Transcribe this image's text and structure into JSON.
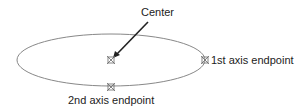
{
  "diagram": {
    "labels": {
      "center": "Center",
      "first_axis": "1st axis endpoint",
      "second_axis": "2nd axis endpoint"
    },
    "colors": {
      "ellipse": "#888888",
      "arrow": "#222222",
      "marker": "#666666",
      "text": "#222222"
    }
  }
}
